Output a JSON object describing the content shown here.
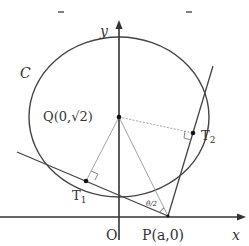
{
  "figure": {
    "labels": {
      "curve": "C",
      "y_axis": "y",
      "x_axis": "x",
      "origin": "O",
      "center": "Q(0,√2)",
      "tangent_point_1": "T",
      "tangent_point_1_sub": "1",
      "tangent_point_2": "T",
      "tangent_point_2_sub": "2",
      "point_p": "P(a,0)",
      "angle": "θ/2"
    },
    "colors": {
      "stroke": "#444444",
      "light_stroke": "#888888",
      "text": "#333333"
    }
  }
}
